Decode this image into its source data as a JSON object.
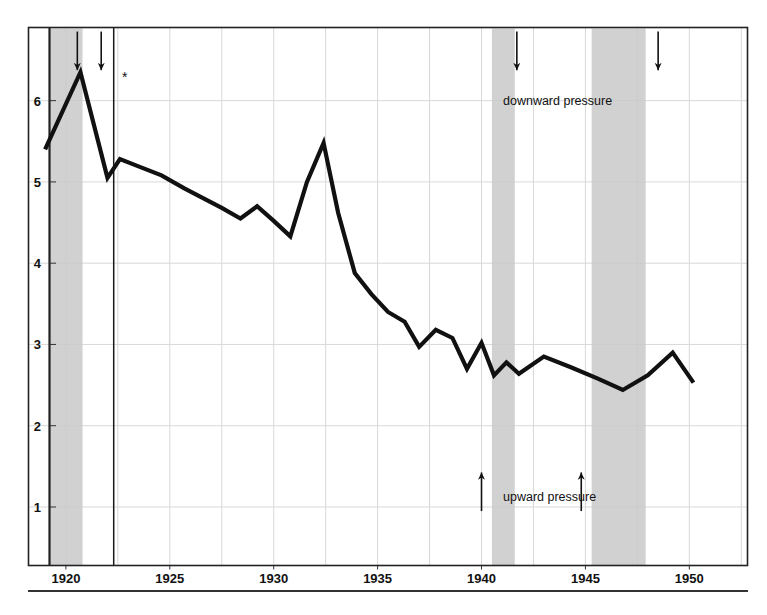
{
  "chart_data": {
    "type": "line",
    "title": "",
    "subtitle": "",
    "xlabel": "",
    "ylabel": "",
    "xlim": [
      1918.2,
      1952.8
    ],
    "ylim": [
      0.28,
      6.9
    ],
    "grid": true,
    "legend_position": "none",
    "x_ticks": [
      1920,
      1925,
      1930,
      1935,
      1940,
      1945,
      1950
    ],
    "x_tick_labels": [
      "1920",
      "1925",
      "1930",
      "1935",
      "1940",
      "1945",
      "1950"
    ],
    "y_ticks": [
      1,
      2,
      3,
      4,
      5,
      6
    ],
    "y_tick_labels": [
      "1",
      "2",
      "3",
      "4",
      "5",
      "6"
    ],
    "series": [
      {
        "name": "series-1",
        "x": [
          1919.0,
          1920.7,
          1922.0,
          1922.6,
          1923.4,
          1924.6,
          1925.7,
          1926.6,
          1927.5,
          1928.4,
          1929.2,
          1930.0,
          1930.8,
          1931.6,
          1932.4,
          1933.1,
          1933.9,
          1934.7,
          1935.5,
          1936.3,
          1937.0,
          1937.8,
          1938.6,
          1939.3,
          1940.0,
          1940.6,
          1941.2,
          1941.8,
          1943.0,
          1944.3,
          1945.6,
          1946.8,
          1948.0,
          1949.2,
          1950.2
        ],
        "y": [
          5.4,
          6.35,
          5.05,
          5.28,
          5.2,
          5.08,
          4.92,
          4.8,
          4.68,
          4.55,
          4.7,
          4.52,
          4.33,
          5.0,
          5.48,
          4.62,
          3.88,
          3.62,
          3.4,
          3.28,
          2.97,
          3.18,
          3.08,
          2.7,
          3.02,
          2.62,
          2.78,
          2.64,
          2.85,
          2.72,
          2.58,
          2.44,
          2.62,
          2.9,
          2.53
        ]
      }
    ],
    "shaded_bands": [
      {
        "name": "band-1",
        "x_start": 1919.2,
        "x_end": 1920.8
      },
      {
        "name": "band-2",
        "x_start": 1940.5,
        "x_end": 1941.6
      },
      {
        "name": "band-3",
        "x_start": 1945.3,
        "x_end": 1947.9
      }
    ],
    "vertical_rule": {
      "name": "vertical-rule",
      "x": 1922.3
    },
    "band_color": "#c9c9c9",
    "line_color": "#111111",
    "grid_color": "#d8d8d8",
    "frame_color": "#222222"
  },
  "annotations": {
    "downward_label": "downward pressure",
    "upward_label": "upward pressure",
    "asterisk": "*",
    "down_arrows": [
      {
        "name": "down-arrow-1",
        "x": 1920.55,
        "y_top": 6.85,
        "y_bottom": 6.35
      },
      {
        "name": "down-arrow-2",
        "x": 1921.7,
        "y_top": 6.85,
        "y_bottom": 6.35
      },
      {
        "name": "down-arrow-3",
        "x": 1941.7,
        "y_top": 6.85,
        "y_bottom": 6.35
      },
      {
        "name": "down-arrow-4",
        "x": 1948.5,
        "y_top": 6.85,
        "y_bottom": 6.35
      }
    ],
    "up_arrows": [
      {
        "name": "up-arrow-1",
        "x": 1940.0,
        "y_top": 1.45,
        "y_bottom": 0.95
      },
      {
        "name": "up-arrow-2",
        "x": 1944.8,
        "y_top": 1.45,
        "y_bottom": 0.95
      }
    ]
  }
}
